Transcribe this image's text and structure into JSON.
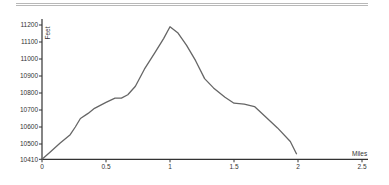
{
  "chart_data": {
    "type": "line",
    "title": "",
    "xlabel": "Miles",
    "ylabel": "Feet",
    "xlim": [
      0,
      2.5
    ],
    "ylim": [
      10410,
      11200
    ],
    "x_ticks": [
      0,
      0.5,
      1,
      1.5,
      2,
      2.5
    ],
    "x_tick_labels": [
      "0",
      "0.5",
      "1",
      "1.5",
      "2",
      "2.5"
    ],
    "y_ticks": [
      10410,
      10500,
      10600,
      10700,
      10800,
      10900,
      11000,
      11100,
      11200
    ],
    "y_tick_labels": [
      "10410",
      "10500",
      "10600",
      "10700",
      "10800",
      "10900",
      "11000",
      "11100",
      "11200"
    ],
    "grid": false,
    "legend": null,
    "series": [
      {
        "name": "Elevation",
        "color": "#666666",
        "x": [
          0,
          0.06,
          0.14,
          0.22,
          0.26,
          0.3,
          0.36,
          0.41,
          0.5,
          0.57,
          0.62,
          0.67,
          0.73,
          0.8,
          0.88,
          0.95,
          1.0,
          1.06,
          1.13,
          1.2,
          1.27,
          1.34,
          1.43,
          1.5,
          1.58,
          1.66,
          1.74,
          1.84,
          1.94,
          1.99
        ],
        "values": [
          10410,
          10450,
          10505,
          10555,
          10600,
          10650,
          10680,
          10710,
          10745,
          10770,
          10770,
          10790,
          10840,
          10940,
          11035,
          11120,
          11190,
          11155,
          11080,
          10990,
          10885,
          10830,
          10775,
          10740,
          10735,
          10720,
          10665,
          10595,
          10515,
          10440
        ]
      }
    ]
  },
  "colors": {
    "line": "#666666",
    "axis": "#333333",
    "rule": "#b8b8b8"
  }
}
